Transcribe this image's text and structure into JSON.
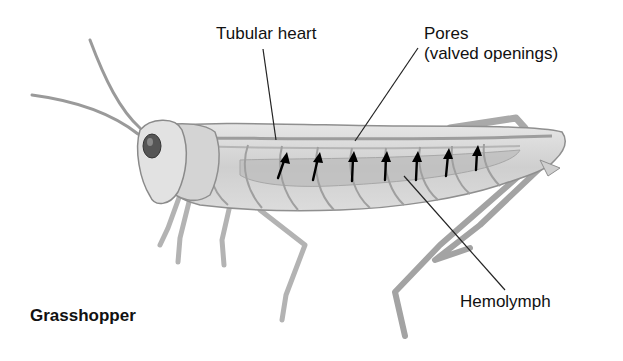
{
  "figure": {
    "title": "Grasshopper",
    "labels": {
      "tubular_heart": "Tubular heart",
      "pores": "Pores",
      "pores_detail": "(valved openings)",
      "hemolymph": "Hemolymph"
    },
    "arrow_count": 7,
    "colors": {
      "background": "#ffffff",
      "body_fill": "#d9d9d9",
      "body_outline": "#8a8a8a",
      "leader_line": "#222222",
      "arrow": "#000000",
      "text": "#111111"
    }
  }
}
